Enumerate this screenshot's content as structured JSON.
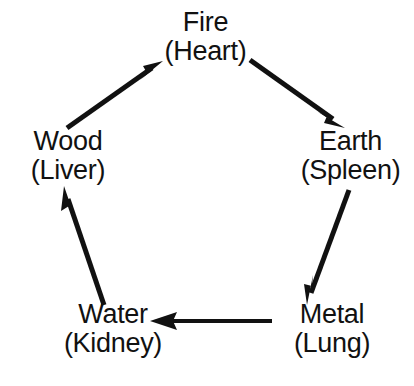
{
  "diagram": {
    "background_color": "#ffffff",
    "stroke_color": "#111111",
    "text_color": "#111111",
    "nodes": [
      {
        "id": "fire",
        "element": "Fire",
        "organ": "(Heart)",
        "x": 205,
        "y": 40
      },
      {
        "id": "earth",
        "element": "Earth",
        "organ": "(Spleen)",
        "x": 350,
        "y": 158
      },
      {
        "id": "metal",
        "element": "Metal",
        "organ": "(Lung)",
        "x": 331,
        "y": 332
      },
      {
        "id": "water",
        "element": "Water",
        "organ": "(Kidney)",
        "x": 112,
        "y": 332
      },
      {
        "id": "wood",
        "element": "Wood",
        "organ": "(Liver)",
        "x": 67,
        "y": 158
      }
    ],
    "arrows": [
      {
        "id": "wood-to-fire",
        "from": "wood",
        "to": "fire",
        "x1": 67,
        "y1": 128,
        "x2": 163,
        "y2": 61
      },
      {
        "id": "fire-to-earth",
        "from": "fire",
        "to": "earth",
        "x1": 250,
        "y1": 60,
        "x2": 345,
        "y2": 128
      },
      {
        "id": "earth-to-metal",
        "from": "earth",
        "to": "metal",
        "x1": 349,
        "y1": 190,
        "x2": 307,
        "y2": 305
      },
      {
        "id": "metal-to-water",
        "from": "metal",
        "to": "water",
        "x1": 272,
        "y1": 321,
        "x2": 150,
        "y2": 321
      },
      {
        "id": "water-to-wood",
        "from": "water",
        "to": "wood",
        "x1": 104,
        "y1": 305,
        "x2": 64,
        "y2": 186
      }
    ]
  }
}
